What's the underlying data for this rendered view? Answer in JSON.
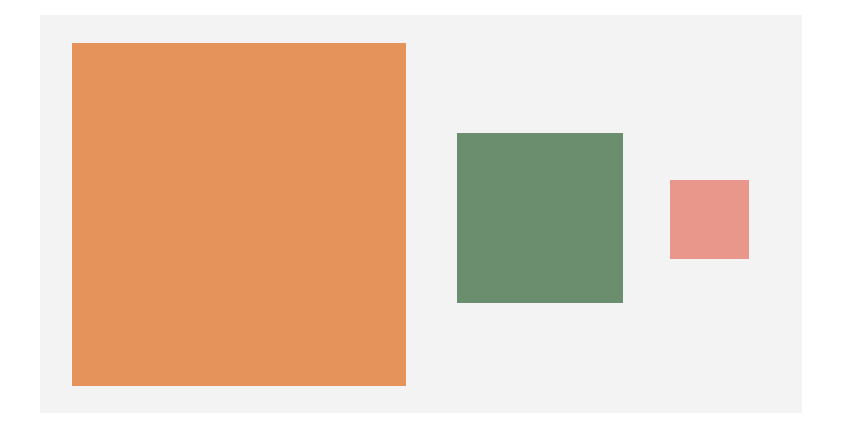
{
  "scene": {
    "background_color": "#ffffff",
    "panel": {
      "color": "#f3f3f3",
      "x": 40,
      "y": 15,
      "width": 762,
      "height": 398
    },
    "shapes": [
      {
        "name": "large-orange-rectangle",
        "color": "#e5935a",
        "x": 72,
        "y": 43,
        "width": 334,
        "height": 343
      },
      {
        "name": "medium-green-square",
        "color": "#6b8e6e",
        "x": 457,
        "y": 133,
        "width": 166,
        "height": 170
      },
      {
        "name": "small-pink-square",
        "color": "#e9978a",
        "x": 670,
        "y": 180,
        "width": 79,
        "height": 79
      }
    ]
  }
}
